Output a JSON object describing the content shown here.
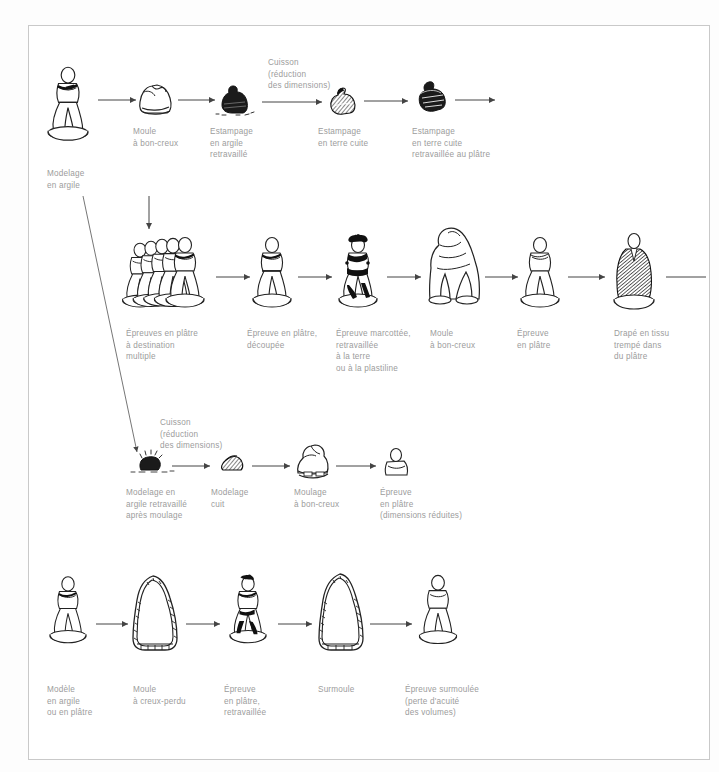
{
  "diagram": {
    "text_color": "#9c9c9c",
    "ink_color": "#1a1a1a",
    "frame_color": "#c9c9c9",
    "background": "#ffffff",
    "rows": [
      {
        "id": "row-1",
        "nodes": [
          {
            "id": "n1",
            "caption": "Modelage\nen argile",
            "icon": "clay-model-figure-icon"
          },
          {
            "id": "n2",
            "caption": "Moule\nà bon-creux",
            "icon": "mould-icon"
          },
          {
            "id": "n3",
            "caption": "Estampage\nen argile\nretravaillé",
            "icon": "dark-clay-stamp-icon"
          },
          {
            "id": "n4",
            "caption": "Estampage\nen terre cuite",
            "icon": "terracotta-stamp-icon"
          },
          {
            "id": "n5",
            "caption": "Estampage\nen terre cuite\nretravaillée au plâtre",
            "icon": "terracotta-plaster-stamp-icon"
          }
        ],
        "note": "Cuisson\n(réduction\ndes dimensions)"
      },
      {
        "id": "row-2",
        "nodes": [
          {
            "id": "n6",
            "caption": "Épreuves en plâtre\nà destination\nmultiple",
            "icon": "multiple-plaster-figures-icon"
          },
          {
            "id": "n7",
            "caption": "Épreuve en plâtre,\ndécoupée",
            "icon": "cut-plaster-figure-icon"
          },
          {
            "id": "n8",
            "caption": "Épreuve marcottée,\nretravaillée\nà la terre\nou à la plastiline",
            "icon": "layered-figure-icon"
          },
          {
            "id": "n9",
            "caption": "Moule\nà bon-creux",
            "icon": "hollow-mould-figure-icon"
          },
          {
            "id": "n10",
            "caption": "Épreuve\nen plâtre",
            "icon": "plaster-proof-figure-icon"
          },
          {
            "id": "n11",
            "caption": "Drapé en tissu\ntrempé dans\ndu plâtre",
            "icon": "draped-dark-figure-icon"
          }
        ]
      },
      {
        "id": "row-3",
        "nodes": [
          {
            "id": "n12",
            "caption": "Modelage en\nargile retravaillé\naprès moulage",
            "icon": "reworked-clay-blob-icon"
          },
          {
            "id": "n13",
            "caption": "Modelage\ncuit",
            "icon": "fired-model-icon"
          },
          {
            "id": "n14",
            "caption": "Moulage\nà bon-creux",
            "icon": "casting-mould-icon"
          },
          {
            "id": "n15",
            "caption": "Épreuve\nen plâtre\n(dimensions réduites)",
            "icon": "small-plaster-bust-icon"
          }
        ],
        "note": "Cuisson\n(réduction\ndes dimensions)"
      },
      {
        "id": "row-4",
        "nodes": [
          {
            "id": "n16",
            "caption": "Modèle\nen argile\nou en plâtre",
            "icon": "model-figure-icon"
          },
          {
            "id": "n17",
            "caption": "Moule\nà creux-perdu",
            "icon": "lost-mould-icon"
          },
          {
            "id": "n18",
            "caption": "Épreuve\nen plâtre,\nretravaillée",
            "icon": "reworked-plaster-figure-icon"
          },
          {
            "id": "n19",
            "caption": "Surmoule",
            "icon": "surmould-icon"
          },
          {
            "id": "n20",
            "caption": "Épreuve surmoulée\n(perte d'acuité\ndes volumes)",
            "icon": "surmoulded-figure-icon"
          }
        ]
      }
    ]
  }
}
